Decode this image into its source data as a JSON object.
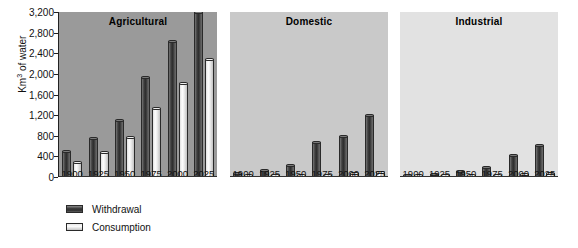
{
  "chart_data": {
    "type": "bar",
    "title": "",
    "xlabel": "",
    "ylabel": "Km3 of water",
    "ylabel_prefix": "Km",
    "ylabel_sup": "3",
    "ylabel_suffix": " of water",
    "ylim": [
      0,
      3200
    ],
    "ytick_values": [
      0,
      400,
      800,
      1200,
      1600,
      2000,
      2400,
      2800,
      3200
    ],
    "ytick_labels": [
      "0",
      "400",
      "800",
      "1,200",
      "1,600",
      "2,000",
      "2,400",
      "2,800",
      "3,200"
    ],
    "categories": [
      "1900",
      "1925",
      "1950",
      "1975",
      "2000",
      "2025"
    ],
    "grid": false,
    "legend_position": "bottom-left",
    "legend": [
      {
        "name": "Withdrawal",
        "color": "#3a3a3a"
      },
      {
        "name": "Consumption",
        "color": "#ededed"
      }
    ],
    "panels": [
      {
        "title": "Agricultural",
        "background": "#9a9a9a",
        "series": [
          {
            "name": "Withdrawal",
            "values": [
              500,
              760,
              1110,
              1930,
              2630,
              3200
            ]
          },
          {
            "name": "Consumption",
            "values": [
              290,
              480,
              780,
              1340,
              1820,
              2280
            ]
          }
        ]
      },
      {
        "title": "Domestic",
        "background": "#c9c9c9",
        "series": [
          {
            "name": "Withdrawal",
            "values": [
              70,
              130,
              230,
              680,
              790,
              1200
            ]
          },
          {
            "name": "Consumption",
            "values": [
              20,
              25,
              35,
              45,
              75,
              90
            ]
          }
        ]
      },
      {
        "title": "Industrial",
        "background": "#e2e2e2",
        "series": [
          {
            "name": "Withdrawal",
            "values": [
              30,
              60,
              110,
              190,
              420,
              620
            ]
          },
          {
            "name": "Consumption",
            "values": [
              20,
              25,
              30,
              35,
              50,
              70
            ]
          }
        ]
      }
    ]
  }
}
